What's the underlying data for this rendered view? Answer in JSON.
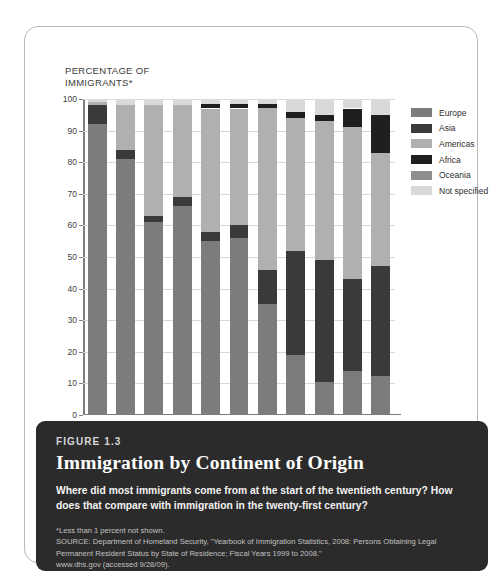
{
  "axis_title": "PERCENTAGE OF IMMIGRANTS*",
  "caption": {
    "figure_number": "FIGURE 1.3",
    "title": "Immigration by Continent of Origin",
    "subtitle": "Where did most immigrants come from at the start of the twentieth century? How does that compare with immigration in the twenty-first century?",
    "footnote": "*Less than 1 percent not shown.",
    "source": "SOURCE: Department of Homeland Security, \"Yearbook of Immigration Statistics, 2008: Persons Obtaining Legal Permanent Resident Status by State of Residence; Fiscal Years 1999 to 2008.\"",
    "url": "www.dhs.gov (accessed 9/28/09)."
  },
  "chart_data": {
    "type": "bar",
    "stacked": true,
    "title": "Immigration by Continent of Origin",
    "xlabel": "",
    "ylabel": "PERCENTAGE OF IMMIGRANTS*",
    "ylim": [
      0,
      100
    ],
    "yticks": [
      0,
      10,
      20,
      30,
      40,
      50,
      60,
      70,
      80,
      90,
      100
    ],
    "grid": true,
    "legend_position": "right",
    "categories": [
      "1900s",
      "1910s",
      "1920s",
      "1930s",
      "1940s",
      "1950s",
      "1960s",
      "1970s",
      "1980s",
      "1990s",
      "2000s"
    ],
    "series": [
      {
        "name": "Europe",
        "color": "#7c7c7c",
        "values": [
          92,
          81,
          61,
          66,
          55,
          56,
          35,
          19,
          10.5,
          14,
          12.5
        ]
      },
      {
        "name": "Asia",
        "color": "#3a3a3a",
        "values": [
          6,
          3,
          2,
          3,
          3,
          4,
          11,
          33,
          38.5,
          29,
          34.5
        ]
      },
      {
        "name": "Americas",
        "color": "#b0b0b0",
        "values": [
          1,
          14,
          35,
          29,
          39,
          37,
          51,
          42,
          44,
          48,
          36
        ]
      },
      {
        "name": "Africa",
        "color": "#1f1f1f",
        "values": [
          0,
          0,
          0,
          0,
          1.5,
          1.5,
          1.5,
          2,
          2,
          6,
          12
        ]
      },
      {
        "name": "Oceania",
        "color": "#8e8e8e",
        "values": [
          0,
          0,
          0,
          0,
          0,
          0,
          0,
          0,
          0,
          0,
          0
        ]
      },
      {
        "name": "Not specified",
        "color": "#d9d9d9",
        "values": [
          1,
          2,
          2,
          2,
          1.5,
          1.5,
          1.5,
          4,
          5,
          3,
          5
        ]
      }
    ]
  }
}
